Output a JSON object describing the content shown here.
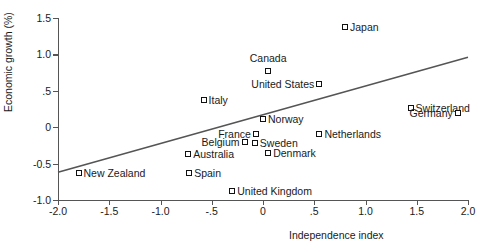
{
  "chart_data": {
    "type": "scatter",
    "title": "",
    "xlabel": "Independence index",
    "ylabel": "Economic growth (%)",
    "xlim": [
      -2.0,
      2.0
    ],
    "ylim": [
      -1.0,
      1.5
    ],
    "grid": false,
    "legend": "none",
    "xticks": [
      "-2.0",
      "-1.5",
      "-1.0",
      "-.5",
      "0",
      ".5",
      "1.0",
      "1.5",
      "2.0"
    ],
    "xtickvalues": [
      -2.0,
      -1.5,
      -1.0,
      -0.5,
      0,
      0.5,
      1.0,
      1.5,
      2.0
    ],
    "yticks": [
      "1.5",
      "1.0",
      ".5",
      "0",
      "-0.5",
      "-1.0"
    ],
    "ytickvalues": [
      1.5,
      1.0,
      0.5,
      0,
      -0.5,
      -1.0
    ],
    "points": [
      {
        "label": "Japan",
        "x": 0.8,
        "y": 1.38,
        "pos": "right"
      },
      {
        "label": "Canada",
        "x": 0.05,
        "y": 0.77,
        "pos": "above"
      },
      {
        "label": "United States",
        "x": 0.55,
        "y": 0.6,
        "pos": "left"
      },
      {
        "label": "Italy",
        "x": -0.58,
        "y": 0.37,
        "pos": "right"
      },
      {
        "label": "Switzerland",
        "x": 1.44,
        "y": 0.26,
        "pos": "right"
      },
      {
        "label": "Germany",
        "x": 1.9,
        "y": 0.2,
        "pos": "left"
      },
      {
        "label": "Norway",
        "x": 0.0,
        "y": 0.11,
        "pos": "right"
      },
      {
        "label": "Netherlands",
        "x": 0.55,
        "y": -0.09,
        "pos": "right"
      },
      {
        "label": "France",
        "x": -0.07,
        "y": -0.1,
        "pos": "left"
      },
      {
        "label": "Belgium",
        "x": -0.18,
        "y": -0.21,
        "pos": "left"
      },
      {
        "label": "Sweden",
        "x": -0.08,
        "y": -0.22,
        "pos": "right"
      },
      {
        "label": "Denmark",
        "x": 0.05,
        "y": -0.36,
        "pos": "right"
      },
      {
        "label": "Australia",
        "x": -0.73,
        "y": -0.37,
        "pos": "right"
      },
      {
        "label": "Spain",
        "x": -0.72,
        "y": -0.63,
        "pos": "right"
      },
      {
        "label": "New Zealand",
        "x": -1.8,
        "y": -0.63,
        "pos": "right"
      },
      {
        "label": "United Kingdom",
        "x": -0.3,
        "y": -0.88,
        "pos": "right"
      }
    ],
    "trendline": {
      "x0": -2.0,
      "y0": -0.62,
      "x1": 2.0,
      "y1": 0.96
    },
    "colors": {
      "marker_edge": "#111111",
      "marker_fill": "#ffffff",
      "line": "#555555",
      "axis": "#555555"
    }
  }
}
